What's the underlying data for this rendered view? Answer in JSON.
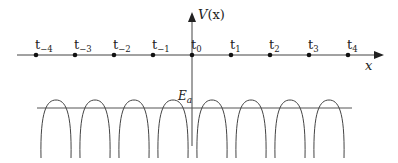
{
  "diagram": {
    "axes": {
      "y_label_main": "V",
      "y_label_arg": "(x)",
      "x_label": "x"
    },
    "sites": [
      {
        "base": "t",
        "sub": "−4",
        "x": 36
      },
      {
        "base": "t",
        "sub": "−3",
        "x": 75
      },
      {
        "base": "t",
        "sub": "−2",
        "x": 114
      },
      {
        "base": "t",
        "sub": "−1",
        "x": 153
      },
      {
        "base": "t",
        "sub": "0",
        "x": 192
      },
      {
        "base": "t",
        "sub": "1",
        "x": 231
      },
      {
        "base": "t",
        "sub": "2",
        "x": 270
      },
      {
        "base": "t",
        "sub": "3",
        "x": 309
      },
      {
        "base": "t",
        "sub": "4",
        "x": 348
      }
    ],
    "energy_level": {
      "base": "E",
      "sub": "a"
    },
    "colors": {
      "line": "#444444",
      "text": "#222222"
    }
  }
}
